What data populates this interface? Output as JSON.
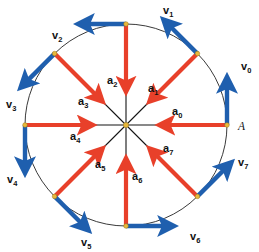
{
  "figure": {
    "background_color": "#ffffff",
    "circle": {
      "center_x": 126,
      "center_y": 125,
      "radius": 101,
      "stroke_color": "#3a3a3a",
      "stroke_width": 1
    },
    "colors": {
      "velocity": "#1f5fae",
      "acceleration": "#e8402a",
      "radius_line": "#141414",
      "vertex_dot": "#e8b83c",
      "text": "#111111"
    },
    "point_label": {
      "text": "A",
      "x": 238,
      "y": 130
    }
  },
  "chart_data": {
    "type": "scatter",
    "xlabel": "",
    "ylabel": "",
    "center": {
      "x": 126,
      "y": 125
    },
    "radius": 101,
    "n_points": 8,
    "angle_step_deg": 45,
    "points": [
      {
        "index": 0,
        "angle_deg": 0,
        "x": 227,
        "y": 125,
        "velocity_label": "v",
        "velocity_sub": "0",
        "velocity_dir_deg": 90,
        "velocity_label_x": 241,
        "velocity_label_y": 70,
        "accel_label": "a",
        "accel_sub": "0",
        "accel_label_x": 172,
        "accel_label_y": 115,
        "is_marked_point": true
      },
      {
        "index": 1,
        "angle_deg": 45,
        "x": 197,
        "y": 54,
        "velocity_label": "v",
        "velocity_sub": "1",
        "velocity_dir_deg": 135,
        "velocity_label_x": 163,
        "velocity_label_y": 14,
        "accel_label": "a",
        "accel_sub": "1",
        "accel_label_x": 148,
        "accel_label_y": 92,
        "is_marked_point": false
      },
      {
        "index": 2,
        "angle_deg": 90,
        "x": 126,
        "y": 24,
        "velocity_label": "v",
        "velocity_sub": "2",
        "velocity_dir_deg": 180,
        "velocity_label_x": 52,
        "velocity_label_y": 39,
        "accel_label": "a",
        "accel_sub": "2",
        "accel_label_x": 107,
        "accel_label_y": 84,
        "is_marked_point": false
      },
      {
        "index": 3,
        "angle_deg": 135,
        "x": 55,
        "y": 54,
        "velocity_label": "v",
        "velocity_sub": "3",
        "velocity_dir_deg": 225,
        "velocity_label_x": 6,
        "velocity_label_y": 108,
        "accel_label": "a",
        "accel_sub": "3",
        "accel_label_x": 78,
        "accel_label_y": 105,
        "is_marked_point": false
      },
      {
        "index": 4,
        "angle_deg": 180,
        "x": 25,
        "y": 125,
        "velocity_label": "v",
        "velocity_sub": "4",
        "velocity_dir_deg": 270,
        "velocity_label_x": 7,
        "velocity_label_y": 183,
        "accel_label": "a",
        "accel_sub": "4",
        "accel_label_x": 70,
        "accel_label_y": 140,
        "is_marked_point": false
      },
      {
        "index": 5,
        "angle_deg": 225,
        "x": 55,
        "y": 196,
        "velocity_label": "v",
        "velocity_sub": "5",
        "velocity_dir_deg": 315,
        "velocity_label_x": 81,
        "velocity_label_y": 246,
        "accel_label": "a",
        "accel_sub": "5",
        "accel_label_x": 95,
        "accel_label_y": 168,
        "is_marked_point": false
      },
      {
        "index": 6,
        "angle_deg": 270,
        "x": 126,
        "y": 226,
        "velocity_label": "v",
        "velocity_sub": "6",
        "velocity_dir_deg": 0,
        "velocity_label_x": 190,
        "velocity_label_y": 240,
        "accel_label": "a",
        "accel_sub": "6",
        "accel_label_x": 132,
        "accel_label_y": 180,
        "is_marked_point": false
      },
      {
        "index": 7,
        "angle_deg": 315,
        "x": 197,
        "y": 196,
        "velocity_label": "v",
        "velocity_sub": "7",
        "velocity_dir_deg": 45,
        "velocity_label_x": 238,
        "velocity_label_y": 166,
        "accel_label": "a",
        "accel_sub": "7",
        "accel_label_x": 163,
        "accel_label_y": 152,
        "is_marked_point": false
      }
    ]
  }
}
